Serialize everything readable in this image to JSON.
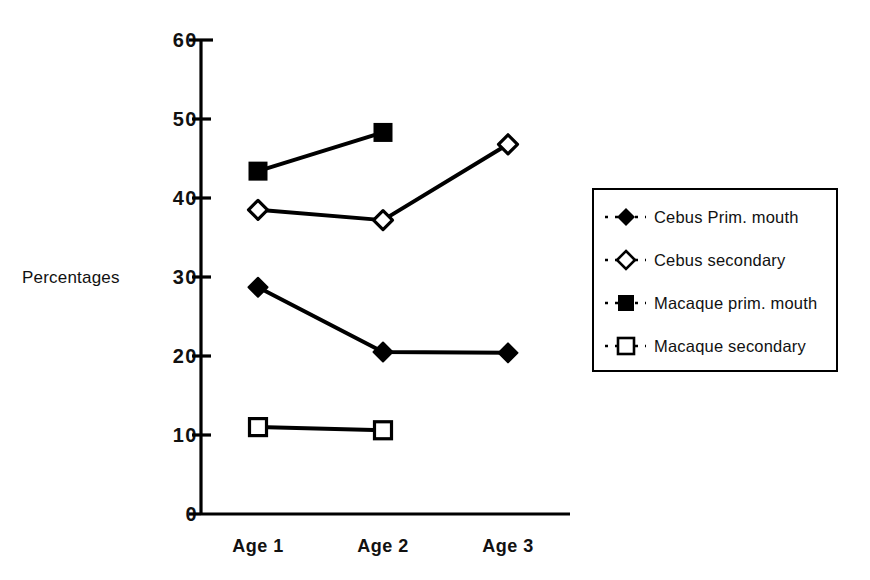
{
  "chart_data": {
    "type": "line",
    "title": "",
    "xlabel": "",
    "ylabel": "Percentages",
    "categories": [
      "Age 1",
      "Age 2",
      "Age 3"
    ],
    "ylim": [
      0,
      60
    ],
    "yticks": [
      0,
      10,
      20,
      30,
      40,
      50,
      60
    ],
    "ytick_labels": [
      "0",
      "10",
      "20",
      "30",
      "40",
      "50",
      "60"
    ],
    "grid": false,
    "legend_position": "right",
    "series": [
      {
        "name": "Cebus Prim. mouth",
        "marker": "filled-diamond",
        "values": [
          28.7,
          20.5,
          20.4
        ]
      },
      {
        "name": "Cebus secondary",
        "marker": "open-diamond",
        "values": [
          38.5,
          37.2,
          46.8
        ]
      },
      {
        "name": "Macaque prim. mouth",
        "marker": "filled-square",
        "values": [
          43.4,
          48.3,
          null
        ]
      },
      {
        "name": "Macaque secondary",
        "marker": "open-square",
        "values": [
          11.0,
          10.6,
          null
        ]
      }
    ]
  },
  "axis": {
    "y_title": "Percentages",
    "y_ticks": [
      "60",
      "50",
      "40",
      "30",
      "20",
      "10",
      "0"
    ],
    "x_ticks": [
      "Age 1",
      "Age 2",
      "Age 3"
    ]
  },
  "legend": {
    "entries": [
      {
        "label": "Cebus Prim. mouth"
      },
      {
        "label": "Cebus secondary"
      },
      {
        "label": "Macaque prim. mouth"
      },
      {
        "label": "Macaque secondary"
      }
    ]
  },
  "colors": {
    "ink": "#000000",
    "background": "#ffffff"
  }
}
